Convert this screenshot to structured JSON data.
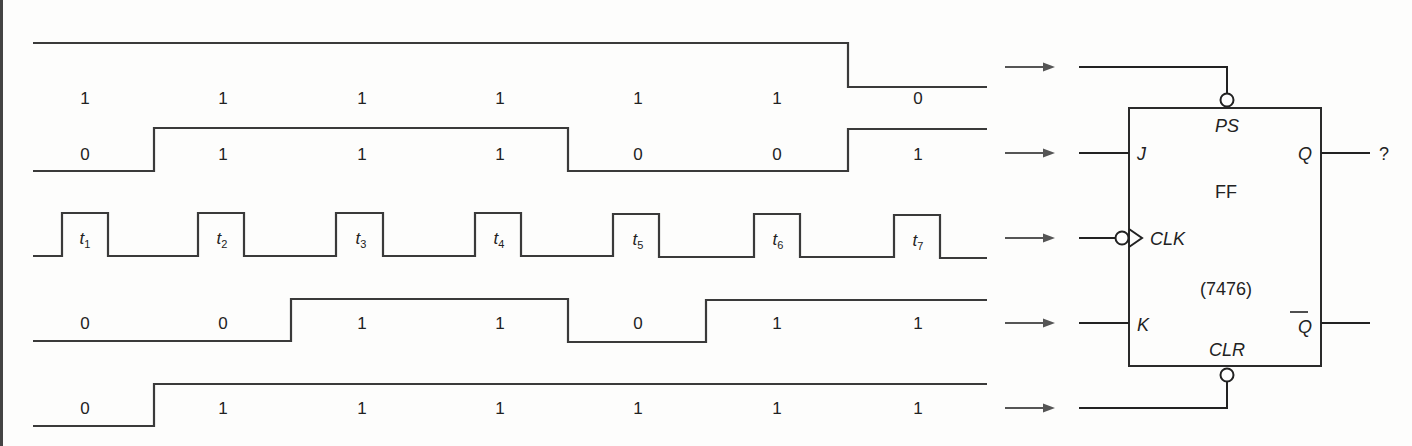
{
  "diagram": {
    "clock_pulses": [
      "t1",
      "t2",
      "t3",
      "t4",
      "t5",
      "t6",
      "t7"
    ],
    "clock_label_prefix": "t",
    "clock_label_subs": [
      "1",
      "2",
      "3",
      "4",
      "5",
      "6",
      "7"
    ],
    "waveforms": [
      {
        "name": "PS",
        "levels": [
          "1",
          "1",
          "1",
          "1",
          "1",
          "1",
          "0"
        ]
      },
      {
        "name": "J",
        "levels": [
          "0",
          "1",
          "1",
          "1",
          "0",
          "0",
          "1"
        ]
      },
      {
        "name": "CLK",
        "levels": []
      },
      {
        "name": "K",
        "levels": [
          "0",
          "0",
          "1",
          "1",
          "0",
          "1",
          "1"
        ]
      },
      {
        "name": "CLR",
        "levels": [
          "0",
          "1",
          "1",
          "1",
          "1",
          "1",
          "1"
        ]
      }
    ],
    "flip_flop": {
      "name": "FF",
      "part_number": "(7476)",
      "pins": {
        "ps": "PS",
        "j": "J",
        "clk": "CLK",
        "k": "K",
        "clr": "CLR",
        "q": "Q",
        "q_bar": "Q"
      },
      "q_output_value": "?"
    },
    "colors": {
      "line": "#3a3a3a",
      "wire": "#222222",
      "arrow": "#555555",
      "background": "#fdfdfc"
    }
  }
}
